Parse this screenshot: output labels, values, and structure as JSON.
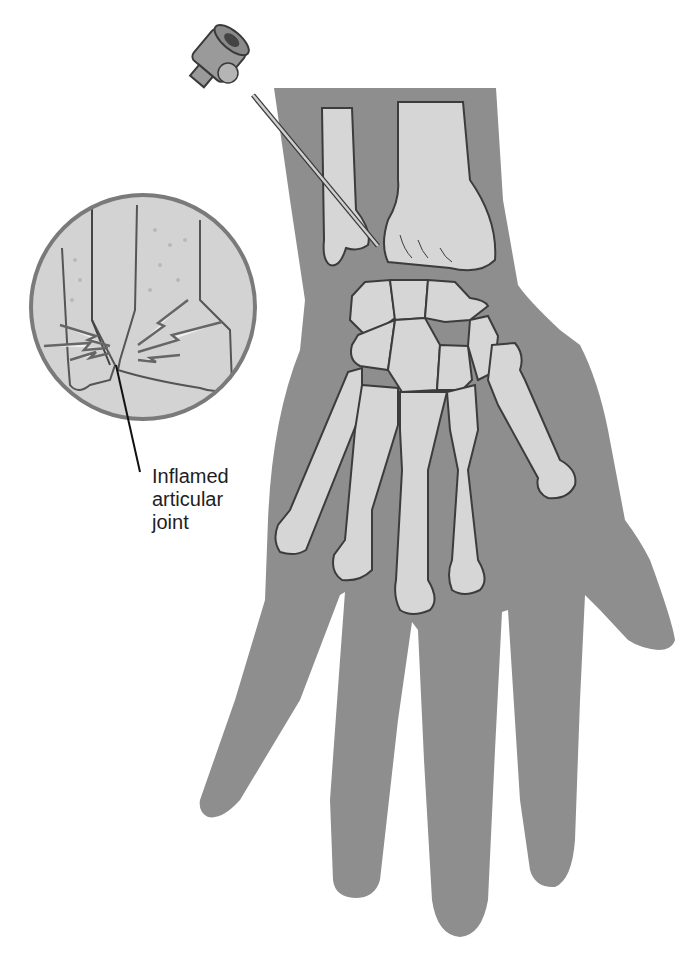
{
  "figure": {
    "colors": {
      "skin": "#8e8e8e",
      "bone": "#d6d6d6",
      "bone_outline": "#3c3c3c",
      "inset_bg": "#d3d3d3",
      "inset_ring": "#7a7a7a",
      "needle_hub": "#9a9a9a",
      "background": "#ffffff"
    },
    "elements": [
      {
        "name": "needle",
        "description": "Hypodermic needle inserted at radiocarpal joint from upper left"
      },
      {
        "name": "forearm",
        "description": "Distal radius and ulna"
      },
      {
        "name": "carpals",
        "description": "Carpal bones of wrist"
      },
      {
        "name": "metacarpals",
        "description": "Five metacarpal bones"
      },
      {
        "name": "inset-circle",
        "description": "Magnified view of inflamed joint with pain bolts"
      }
    ]
  },
  "labels": {
    "inflamed_joint": [
      "Inflamed",
      "articular",
      "joint"
    ]
  },
  "caption": {
    "text": "",
    "note": "caption truncated at image bottom edge, unreadable"
  }
}
